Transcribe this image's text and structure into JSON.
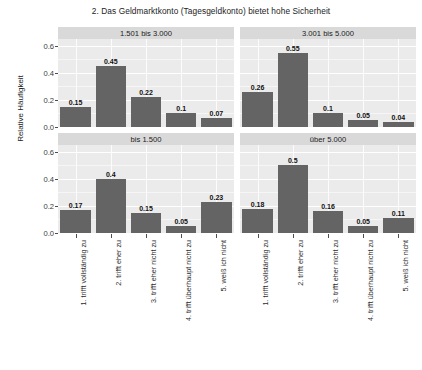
{
  "chart_data": {
    "type": "bar",
    "title": "2. Das Geldmarktkonto (Tagesgeldkonto) bietet hohe Sicherheit",
    "xlabel": "",
    "ylabel": "Relative Häufigkeit",
    "ylim": [
      0,
      0.65
    ],
    "yticks": [
      "0.0",
      "0.2",
      "0.4",
      "0.6"
    ],
    "ytick_values": [
      0.0,
      0.2,
      0.4,
      0.6
    ],
    "grid": true,
    "legend": "none",
    "facet_layout": "2x2",
    "categories": [
      "1. trifft vollständig zu",
      "2. trifft eher zu",
      "3. trifft eher nicht zu",
      "4. trifft überhaupt nicht zu",
      "5. weiß ich nicht"
    ],
    "facets": [
      {
        "strip": "1.501 bis 3.000",
        "row": 0,
        "col": 0,
        "values": [
          0.15,
          0.45,
          0.22,
          0.1,
          0.07
        ],
        "labels": [
          "0.15",
          "0.45",
          "0.22",
          "0.1",
          "0.07"
        ]
      },
      {
        "strip": "3.001 bis 5.000",
        "row": 0,
        "col": 1,
        "values": [
          0.26,
          0.55,
          0.1,
          0.05,
          0.04
        ],
        "labels": [
          "0.26",
          "0.55",
          "0.1",
          "0.05",
          "0.04"
        ]
      },
      {
        "strip": "bis 1.500",
        "row": 1,
        "col": 0,
        "values": [
          0.17,
          0.4,
          0.15,
          0.05,
          0.23
        ],
        "labels": [
          "0.17",
          "0.4",
          "0.15",
          "0.05",
          "0.23"
        ]
      },
      {
        "strip": "über 5.000",
        "row": 1,
        "col": 1,
        "values": [
          0.18,
          0.5,
          0.16,
          0.05,
          0.11
        ],
        "labels": [
          "0.18",
          "0.5",
          "0.16",
          "0.05",
          "0.11"
        ]
      }
    ],
    "colors": {
      "bar": "#646464",
      "panel_background": "#ebebeb",
      "strip_background": "#d9d9d9",
      "gridline": "#ffffff",
      "text": "#2b2b2b",
      "page_background": "#ffffff"
    }
  }
}
